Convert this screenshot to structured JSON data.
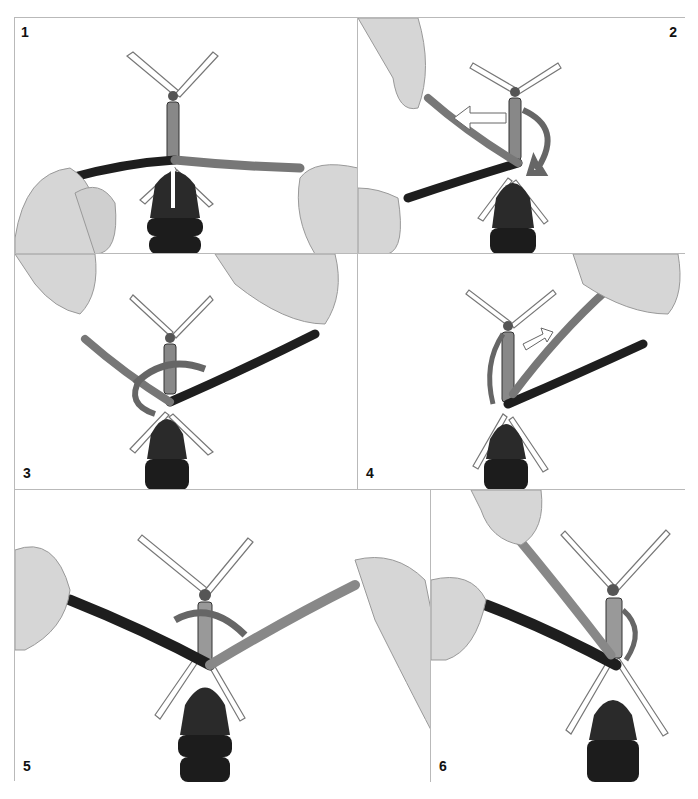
{
  "figure": {
    "panels": [
      {
        "number": "1",
        "step": "Hold both chenille strands out horizontally from the hook"
      },
      {
        "number": "2",
        "step": "Bring the rear strand over and around the shank"
      },
      {
        "number": "3",
        "step": "Wrap strand around the shank, crossing the other strand"
      },
      {
        "number": "4",
        "step": "Continue wrapping forward up the shank"
      },
      {
        "number": "5",
        "step": "Alternate strands, wrapping around the shank"
      },
      {
        "number": "6",
        "step": "Complete wraps toward the head of the hook"
      }
    ]
  },
  "colors": {
    "border": "#b9b9b9",
    "chenille_dark": "#1e1e1e",
    "chenille_light": "#8a8a8a",
    "skin": "#d8d8d8",
    "vise": "#222222"
  }
}
